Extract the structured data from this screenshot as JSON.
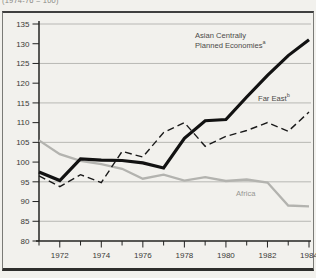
{
  "subtitle": "(1974-76 = 100)",
  "chart_data": {
    "type": "line",
    "title": "",
    "xlabel": "",
    "ylabel": "",
    "x": [
      1971,
      1972,
      1973,
      1974,
      1975,
      1976,
      1977,
      1978,
      1979,
      1980,
      1981,
      1982,
      1983,
      1984
    ],
    "x_label_years": [
      1972,
      1974,
      1976,
      1978,
      1980,
      1982,
      1984
    ],
    "ylim": [
      80,
      135
    ],
    "y_ticks": [
      135,
      130,
      125,
      120,
      115,
      110,
      105,
      100,
      95,
      90,
      85,
      80
    ],
    "gridline_values": [
      135,
      125,
      115,
      105,
      95,
      85
    ],
    "grid": true,
    "legend_position": "inline-labels",
    "series": [
      {
        "name": "Asian Centrally Planned Economies",
        "sup": "a",
        "line": "solid",
        "color": "#121212",
        "stroke_width": 3.2,
        "dash": "",
        "z": 3,
        "values": [
          97.5,
          95.3,
          100.8,
          100.5,
          100.4,
          99.8,
          98.5,
          106,
          110.5,
          110.8,
          116.5,
          122,
          127,
          131
        ]
      },
      {
        "name": "Far East",
        "sup": "b",
        "line": "dashed",
        "color": "#1a1a1a",
        "stroke_width": 1.4,
        "dash": "7 4",
        "z": 2,
        "values": [
          96.5,
          93.8,
          96.8,
          94.8,
          102.7,
          101.3,
          107.5,
          110,
          104,
          106.5,
          108,
          110,
          107.8,
          112.7
        ]
      },
      {
        "name": "Africa",
        "sup": "",
        "line": "solid",
        "color": "#b3b3af",
        "stroke_width": 2.3,
        "dash": "",
        "z": 1,
        "values": [
          105.5,
          102,
          100.3,
          99.5,
          98.3,
          95.8,
          96.8,
          95.3,
          96.2,
          95.2,
          95.6,
          94.8,
          89,
          88.8
        ]
      }
    ],
    "labels": {
      "asian_line1": "Asian Centrally",
      "asian_line2": "Planned Economies",
      "asian_sup": "a",
      "far_east": "Far East",
      "far_east_sup": "b",
      "africa": "Africa"
    }
  }
}
